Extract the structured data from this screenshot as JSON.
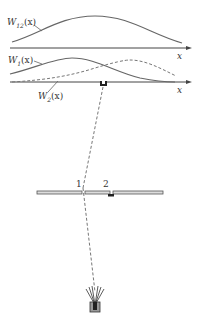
{
  "diagram": {
    "top_plot": {
      "curve_label": "W12(x)",
      "curve_label_main": "W",
      "curve_label_sub": "12",
      "curve_label_arg": "(x)",
      "axis_label": "x"
    },
    "middle_plot": {
      "curve1_label_main": "W",
      "curve1_label_sub": "1",
      "curve1_label_arg": "(x)",
      "curve2_label_main": "W",
      "curve2_label_sub": "2",
      "curve2_label_arg": "(x)",
      "axis_label_upper": "x",
      "axis_label": "x"
    },
    "screen": {
      "slit1_label": "1",
      "slit2_label": "2"
    },
    "colors": {
      "line": "#555555",
      "dashed": "#777777",
      "axis": "#444444"
    }
  }
}
